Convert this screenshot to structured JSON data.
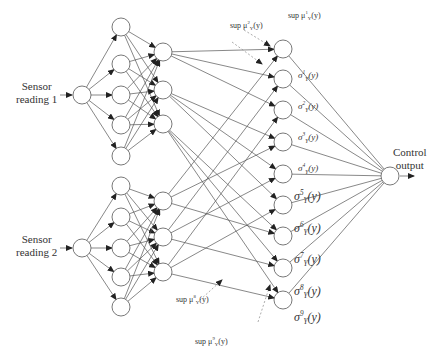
{
  "diagram": {
    "type": "neural-fuzzy-network",
    "inputs": [
      {
        "label_line1": "Sensor",
        "label_line2": "reading 1"
      },
      {
        "label_line1": "Sensor",
        "label_line2": "reading 2"
      }
    ],
    "output": {
      "label_line1": "Control",
      "label_line2": "output"
    },
    "layers": {
      "input_nodes": 2,
      "membership_nodes_per_input": 5,
      "rule_nodes_per_input": 3,
      "consequent_nodes": 9,
      "output_nodes": 1
    },
    "sigma_labels": [
      {
        "base": "σ",
        "sup": "1",
        "sub": "Y",
        "arg": "(y)"
      },
      {
        "base": "σ",
        "sup": "2",
        "sub": "Y",
        "arg": "(y)"
      },
      {
        "base": "σ",
        "sup": "3",
        "sub": "Y",
        "arg": "(y)"
      },
      {
        "base": "σ",
        "sup": "4",
        "sub": "Y",
        "arg": "(y)"
      },
      {
        "base": "σ",
        "sup": "5",
        "sub": "Y",
        "arg": "(y)"
      },
      {
        "base": "σ",
        "sup": "6",
        "sub": "Y",
        "arg": "(y)"
      },
      {
        "base": "σ",
        "sup": "7",
        "sub": "Y",
        "arg": "(y)"
      },
      {
        "base": "σ",
        "sup": "8",
        "sub": "Y",
        "arg": "(y)"
      },
      {
        "base": "σ",
        "sup": "9",
        "sub": "Y",
        "arg": "(y)"
      }
    ],
    "sup_labels": [
      {
        "prefix": "sup μ",
        "sup": "2",
        "sub": "Y",
        "arg": "(y)"
      },
      {
        "prefix": "sup μ",
        "sup": "1",
        "sub": "Y",
        "arg": "(y)"
      },
      {
        "prefix": "sup μ",
        "sup": "8",
        "sub": "Y",
        "arg": "(y)"
      },
      {
        "prefix": "sup μ",
        "sup": "9",
        "sub": "Y",
        "arg": "(y)"
      }
    ]
  }
}
